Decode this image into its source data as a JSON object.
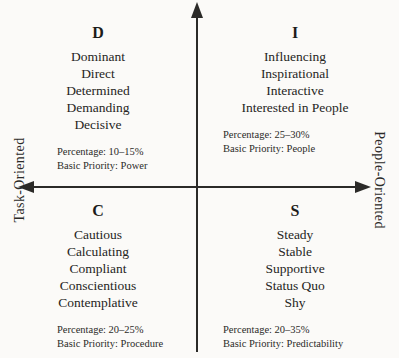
{
  "axes": {
    "vertical_label": "",
    "left_label": "Task-Oriented",
    "right_label": "People-Oriented"
  },
  "quadrants": [
    {
      "letter": "D",
      "position": "top-left",
      "traits": [
        "Dominant",
        "Direct",
        "Determined",
        "Demanding",
        "Decisive"
      ],
      "percentage": "Percentage: 10–15%",
      "priority": "Basic Priority: Power"
    },
    {
      "letter": "I",
      "position": "top-right",
      "traits": [
        "Influencing",
        "Inspirational",
        "Interactive",
        "Interested in People"
      ],
      "percentage": "Percentage: 25–30%",
      "priority": "Basic Priority: People"
    },
    {
      "letter": "C",
      "position": "bottom-left",
      "traits": [
        "Cautious",
        "Calculating",
        "Compliant",
        "Conscientious",
        "Contemplative"
      ],
      "percentage": "Percentage: 20–25%",
      "priority": "Basic Priority: Procedure"
    },
    {
      "letter": "S",
      "position": "bottom-right",
      "traits": [
        "Steady",
        "Stable",
        "Supportive",
        "Status Quo",
        "Shy"
      ],
      "percentage": "Percentage: 20–35%",
      "priority": "Basic Priority: Predictability"
    }
  ],
  "colors": {
    "ink": "#2b2a28",
    "background": "#fbfaf8"
  }
}
